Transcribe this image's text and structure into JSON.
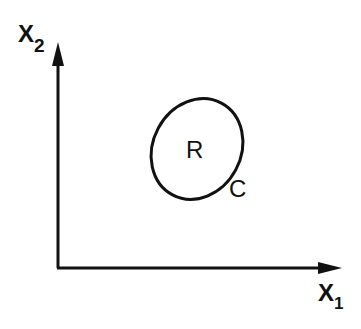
{
  "diagram": {
    "axes": {
      "x_label": "X",
      "x_subscript": "1",
      "y_label": "X",
      "y_subscript": "2"
    },
    "region": {
      "label": "R",
      "boundary_label": "C"
    },
    "colors": {
      "stroke": "#111111",
      "background": "#ffffff"
    }
  }
}
